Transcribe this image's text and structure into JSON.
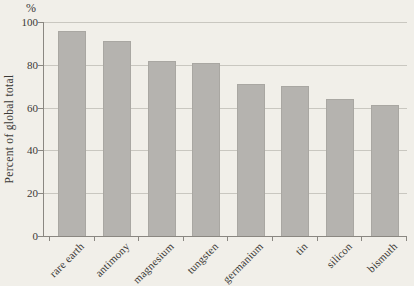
{
  "colors": {
    "background": "#f1efe9",
    "bar": "#b5b3af",
    "bar_border": "#a9a7a2",
    "grid": "#c9c7c0",
    "axis": "#8a8781",
    "text": "#3b3936"
  },
  "chart_data": {
    "type": "bar",
    "categories": [
      "rare earth",
      "antimony",
      "magnesium",
      "tungsten",
      "germanium",
      "tin",
      "silicon",
      "bismuth"
    ],
    "values": [
      96,
      91,
      82,
      81,
      71,
      70,
      64,
      61
    ],
    "title": "",
    "xlabel": "",
    "ylabel": "Percent of global total",
    "unit_label": "%",
    "ylim": [
      0,
      100
    ],
    "yticks": [
      0,
      20,
      40,
      60,
      80,
      100
    ],
    "grid": true,
    "legend": false
  }
}
